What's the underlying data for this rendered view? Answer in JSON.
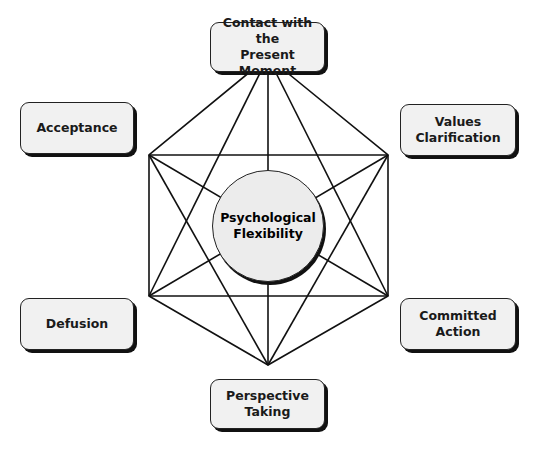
{
  "diagram": {
    "center": {
      "label": "Psychological\nFlexibility"
    },
    "nodes": [
      {
        "id": "contact",
        "label": "Contact with the\nPresent Moment"
      },
      {
        "id": "acceptance",
        "label": "Acceptance"
      },
      {
        "id": "values",
        "label": "Values\nClarification"
      },
      {
        "id": "defusion",
        "label": "Defusion"
      },
      {
        "id": "committed",
        "label": "Committed\nAction"
      },
      {
        "id": "perspective",
        "label": "Perspective\nTaking"
      }
    ]
  }
}
